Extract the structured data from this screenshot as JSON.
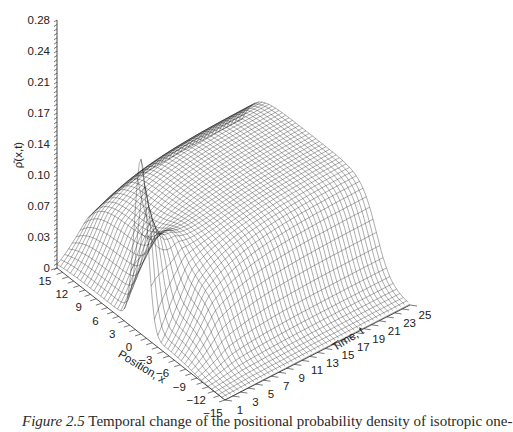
{
  "chart_data": {
    "type": "surface3d",
    "title": "",
    "zlabel": "ρ̂(x,t)",
    "xlabel": "Position, x",
    "ylabel": "Time, t",
    "z_ticks": [
      "0",
      "0.03",
      "0.07",
      "0.10",
      "0.14",
      "0.17",
      "0.21",
      "0.24",
      "0.28"
    ],
    "z_tick_values": [
      0,
      0.035,
      0.07,
      0.105,
      0.14,
      0.175,
      0.21,
      0.245,
      0.28
    ],
    "x_ticks": [
      "15",
      "12",
      "9",
      "6",
      "3",
      "0",
      "−3",
      "−6",
      "−9",
      "−12",
      "−15"
    ],
    "x_tick_values": [
      15,
      12,
      9,
      6,
      3,
      0,
      -3,
      -6,
      -9,
      -12,
      -15
    ],
    "t_ticks": [
      "1",
      "3",
      "5",
      "7",
      "9",
      "11",
      "13",
      "15",
      "17",
      "19",
      "21",
      "23",
      "25"
    ],
    "t_tick_values": [
      1,
      3,
      5,
      7,
      9,
      11,
      13,
      15,
      17,
      19,
      21,
      23,
      25
    ],
    "xlim": [
      -15,
      15
    ],
    "tlim": [
      1,
      25
    ],
    "zlim": [
      0,
      0.28
    ],
    "peak": {
      "x": 0,
      "t": 1,
      "value": 0.24
    },
    "late_time_profile": "broad plateau across x ≈ −9…15, height ≈ 0.10 at t = 25",
    "grid": false,
    "style": "black wireframe mesh on white"
  },
  "caption": {
    "figure_number": "Figure 2.5",
    "text": " Temporal change of the positional probability density of isotropic one-"
  }
}
